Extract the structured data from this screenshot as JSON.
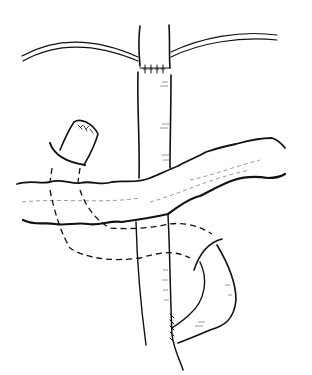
{
  "illustration": {
    "type": "surgical line drawing",
    "background": "#ffffff",
    "stroke_color": "#111111",
    "elements": [
      "vertical-bowel-segment",
      "upper-anastomosis-sutures",
      "mesentery-strands",
      "transverse-colon",
      "closed-stump",
      "dashed-hidden-loops",
      "side-loop-anastomosis"
    ]
  }
}
